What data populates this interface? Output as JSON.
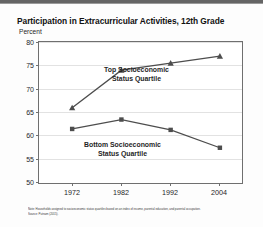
{
  "chart_data": {
    "type": "line",
    "title": "Participation in Extracurricular Activities, 12th Grade",
    "ylabel": "Percent",
    "xlabel": "",
    "categories": [
      "1972",
      "1982",
      "1992",
      "2004"
    ],
    "x": [
      1972,
      1982,
      1992,
      2004
    ],
    "ylim": [
      50,
      80
    ],
    "yticks": [
      "50",
      "55",
      "60",
      "65",
      "70",
      "75",
      "80"
    ],
    "ytick_values": [
      50,
      55,
      60,
      65,
      70,
      75,
      80
    ],
    "grid": true,
    "legend_position": "inline-annotations",
    "series": [
      {
        "name": "Top Socioeconomic Status Quartile",
        "label_line1": "Top Socioeconomic",
        "label_line2": "Status Quartile",
        "marker": "triangle",
        "color": "#4d4d4d",
        "values": [
          66,
          74,
          75.5,
          77
        ]
      },
      {
        "name": "Bottom Socioeconomic Status Quartile",
        "label_line1": "Bottom Socioeconomic",
        "label_line2": "Status Quartile",
        "marker": "square",
        "color": "#4d4d4d",
        "values": [
          61.5,
          63.5,
          61.3,
          57.5
        ]
      }
    ]
  },
  "footnote": {
    "line1": "Note: Households assigned to socioeconomic status quartiles based on an index of income, parental education, and parental occupation.",
    "line2": "Source: Putnam (2015)."
  }
}
